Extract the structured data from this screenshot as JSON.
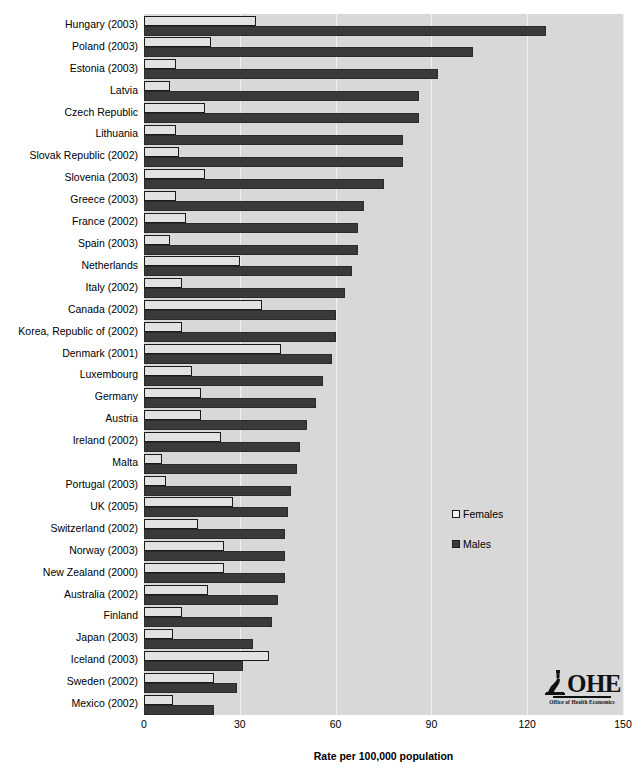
{
  "chart_data": {
    "type": "bar",
    "orientation": "horizontal",
    "title": "",
    "xlabel": "Rate per 100,000 population",
    "ylabel": "",
    "xlim": [
      0,
      150
    ],
    "xticks": [
      0,
      30,
      60,
      90,
      120,
      150
    ],
    "grid": true,
    "legend_position": "middle-right",
    "categories": [
      "Hungary (2003)",
      "Poland (2003)",
      "Estonia (2003)",
      "Latvia",
      "Czech Republic",
      "Lithuania",
      "Slovak Republic (2002)",
      "Slovenia (2003)",
      "Greece (2003)",
      "France (2002)",
      "Spain (2003)",
      "Netherlands",
      "Italy (2002)",
      "Canada (2002)",
      "Korea, Republic of (2002)",
      "Denmark (2001)",
      "Luxembourg",
      "Germany",
      "Austria",
      "Ireland (2002)",
      "Malta",
      "Portugal (2003)",
      "UK (2005)",
      "Switzerland (2002)",
      "Norway (2003)",
      "New Zealand (2000)",
      "Australia (2002)",
      "Finland",
      "Japan (2003)",
      "Iceland (2003)",
      "Sweden (2002)",
      "Mexico (2002)"
    ],
    "series": [
      {
        "name": "Females",
        "color": "#e2e2e2",
        "values": [
          35,
          21,
          10,
          8,
          19,
          10,
          11,
          19,
          10,
          13,
          8,
          30,
          12,
          37,
          12,
          43,
          15,
          18,
          18,
          24,
          5.5,
          7,
          28,
          17,
          25,
          25,
          20,
          12,
          9,
          39,
          22,
          9
        ]
      },
      {
        "name": "Males",
        "color": "#3a3a3a",
        "values": [
          126,
          103,
          92,
          86,
          86,
          81,
          81,
          75,
          69,
          67,
          67,
          65,
          63,
          60,
          60,
          59,
          56,
          54,
          51,
          49,
          48,
          46,
          45,
          44,
          44,
          44,
          42,
          40,
          34,
          31,
          29,
          22
        ]
      }
    ]
  },
  "legend": {
    "items": [
      {
        "label": "Females"
      },
      {
        "label": "Males"
      }
    ]
  },
  "logo": {
    "name": "OHE",
    "subtitle": "Office of Health Economics"
  }
}
